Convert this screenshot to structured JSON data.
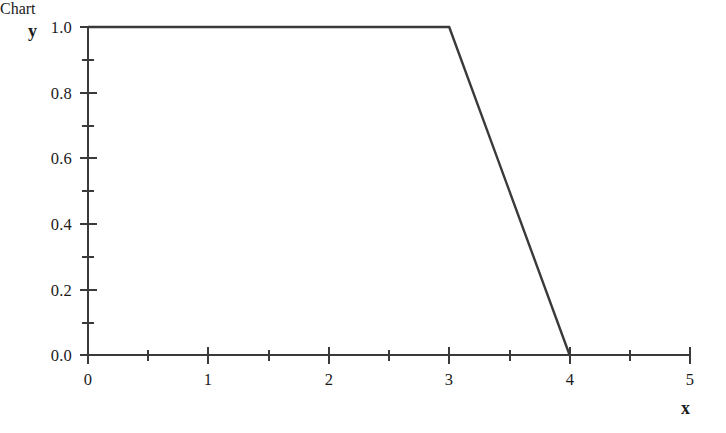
{
  "chart_data": {
    "type": "line",
    "title": "",
    "subtitle": "",
    "xlabel": "x",
    "ylabel": "y",
    "xlim": [
      0,
      5
    ],
    "ylim": [
      0.0,
      1.0
    ],
    "grid": false,
    "legend": null,
    "x_major_ticks": [
      0,
      1,
      2,
      3,
      4,
      5
    ],
    "x_minor_ticks": [
      0.5,
      1.5,
      2.5,
      3.5,
      4.5
    ],
    "x_tick_labels": [
      "0",
      "1",
      "2",
      "3",
      "4",
      "5"
    ],
    "y_major_ticks": [
      0.0,
      0.2,
      0.4,
      0.6,
      0.8,
      1.0
    ],
    "y_minor_ticks": [
      0.1,
      0.3,
      0.5,
      0.7,
      0.9
    ],
    "y_tick_labels": [
      "0.0",
      "0.2",
      "0.4",
      "0.6",
      "0.8",
      "1.0"
    ],
    "series": [
      {
        "name": "",
        "x": [
          0,
          3,
          4
        ],
        "values": [
          1.0,
          1.0,
          0.0
        ]
      }
    ],
    "annotations": [],
    "line_color": "#3a3a3a",
    "axis_color": "#3a3a3a",
    "background_color": "#ffffff"
  },
  "axis_labels": {
    "x_name": "x",
    "y_name": "y"
  }
}
